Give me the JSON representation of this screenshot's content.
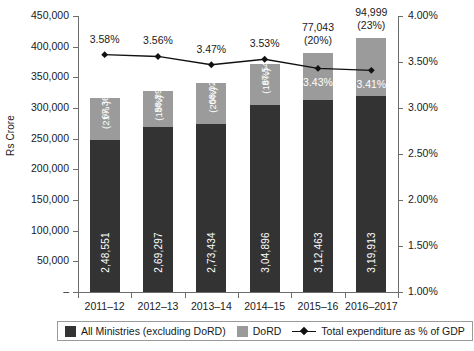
{
  "chart_data": {
    "type": "bar",
    "title": "",
    "subtitle": "",
    "xlabel": "",
    "ylabel": "Rs Crore",
    "y2label": "",
    "categories": [
      "2011–12",
      "2012–13",
      "2013–14",
      "2014–15",
      "2015–16",
      "2016–2017"
    ],
    "ylim": [
      0,
      450000
    ],
    "yticks": [
      "–",
      "50,000",
      "100,000",
      "150,000",
      "200,000",
      "250,000",
      "300,000",
      "350,000",
      "400,000",
      "450,000"
    ],
    "ytick_values": [
      0,
      50000,
      100000,
      150000,
      200000,
      250000,
      300000,
      350000,
      400000,
      450000
    ],
    "y2lim": [
      1.0,
      4.0
    ],
    "y2ticks": [
      "1.00%",
      "1.50%",
      "2.00%",
      "2.50%",
      "3.00%",
      "3.50%",
      "4.00%"
    ],
    "y2tick_values": [
      1.0,
      1.5,
      2.0,
      2.5,
      3.0,
      3.5,
      4.0
    ],
    "grid": false,
    "legend_position": "bottom",
    "series": [
      {
        "name": "All Ministries (excluding DoRD)",
        "type": "bar",
        "color": "#333333",
        "values": [
          248551,
          269297,
          273434,
          304896,
          312463,
          319913
        ],
        "labels": [
          "2,48,551",
          "2,69,297",
          "2,73,434",
          "3,04,896",
          "3,12,463",
          "3,19,913"
        ]
      },
      {
        "name": "DoRD",
        "type": "bar",
        "color": "#9b9b9b",
        "values": [
          67367,
          58893,
          68025,
          67546,
          77043,
          94999
        ],
        "labels": [
          "67,367",
          "58,893",
          "68,025",
          "67,546",
          "77,043",
          "94,999"
        ],
        "share_labels": [
          "(21% )",
          "(18%)",
          "(20%)",
          "(18%)",
          "(20%)",
          "(23%)"
        ],
        "label_placement": [
          "inside",
          "inside",
          "inside",
          "inside",
          "outside",
          "outside"
        ]
      },
      {
        "name": "Total expenditure as % of GDP",
        "type": "line",
        "color": "#111111",
        "values": [
          3.58,
          3.56,
          3.47,
          3.53,
          3.43,
          3.41
        ],
        "labels": [
          "3.58%",
          "3.56%",
          "3.47%",
          "3.53%",
          "3.43%",
          "3.41%"
        ],
        "label_placement": [
          "above",
          "above",
          "above",
          "above",
          "below-on-bar",
          "below-on-bar"
        ]
      }
    ]
  },
  "legend": {
    "items": [
      {
        "label": "All Ministries (excluding DoRD)",
        "marker": "square-dark-swatch"
      },
      {
        "label": "DoRD",
        "marker": "square-gray-swatch"
      },
      {
        "label": "Total expenditure as % of GDP",
        "marker": "line-with-diamond-marker"
      }
    ]
  }
}
